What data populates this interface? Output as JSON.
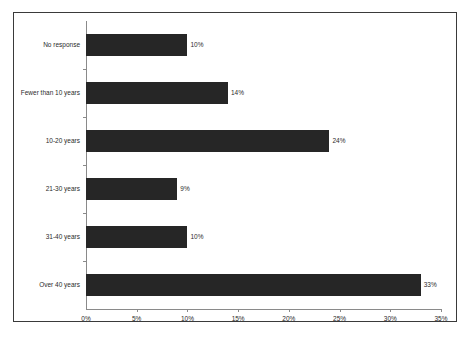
{
  "chart_data": {
    "type": "bar",
    "orientation": "horizontal",
    "title": "",
    "subtitle": "",
    "xlabel": "",
    "ylabel": "",
    "categories": [
      "No response",
      "Fewer than 10 years",
      "10-20 years",
      "21-30 years",
      "31-40 years",
      "Over 40 years"
    ],
    "values": [
      10,
      14,
      24,
      9,
      10,
      33
    ],
    "value_labels": [
      "10%",
      "14%",
      "24%",
      "9%",
      "10%",
      "33%"
    ],
    "xlim": [
      0,
      35
    ],
    "xticks": [
      0,
      5,
      10,
      15,
      20,
      25,
      30,
      35
    ],
    "xtick_labels": [
      "0%",
      "5%",
      "10%",
      "15%",
      "20%",
      "25%",
      "30%",
      "35%"
    ],
    "grid": false,
    "legend": null,
    "bar_color": "#262626",
    "axis_color": "#8a8a8a",
    "text_color": "#2b2b2b",
    "border_color": "#3a3a3a"
  }
}
